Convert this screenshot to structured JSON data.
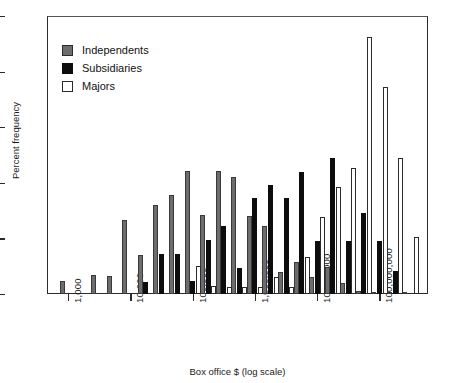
{
  "chart_data": {
    "type": "bar",
    "title": "",
    "xlabel": "Box office $ (log scale)",
    "ylabel": "Percent frequency",
    "ylim": [
      0,
      25
    ],
    "yticks": [
      0,
      5,
      10,
      15,
      20,
      25
    ],
    "xticks": [
      "1,000",
      "10,000",
      "100,000",
      "1,000,000",
      "10,000,000",
      "100,000,000"
    ],
    "xscale": "log",
    "grid": false,
    "legend_position": "top-left",
    "legend": [
      "Independents",
      "Subsidiaries",
      "Majors"
    ],
    "colors": {
      "independents": "#6d6d6d",
      "subsidiaries": "#0d0d0d",
      "majors": "#ffffff",
      "axis": "#2b2b2b"
    },
    "bin_centers_log10": [
      3.0,
      3.5,
      3.75,
      4.0,
      4.25,
      4.5,
      4.75,
      5.0,
      5.25,
      5.5,
      5.75,
      6.0,
      6.25,
      6.5,
      6.75,
      7.0,
      7.25,
      7.5,
      7.75,
      8.0,
      8.25,
      8.5
    ],
    "series": [
      {
        "name": "Independents",
        "values": [
          1.2,
          1.7,
          1.6,
          6.7,
          3.5,
          8.0,
          8.9,
          3.6,
          11.1,
          7.1,
          11.1,
          10.5,
          7.0,
          6.1,
          2.0,
          2.9,
          1.5,
          2.4,
          1.0,
          0.25,
          0.2,
          0.2,
          0.2
        ]
      },
      {
        "name": "Subsidiaries",
        "values": [
          0,
          0,
          0,
          0,
          1.1,
          3.6,
          3.6,
          1.2,
          4.9,
          2.3,
          8.6,
          9.8,
          8.6,
          11.0,
          4.8,
          12.2,
          4.8,
          7.3,
          4.8,
          2.1,
          0
        ]
      },
      {
        "name": "Majors",
        "values": [
          0,
          0,
          0,
          0,
          0,
          0,
          2.5,
          0.7,
          0.65,
          1.5,
          0.6,
          3.3,
          6.9,
          9.6,
          11.3,
          23.1,
          18.6,
          12.2,
          5.1
        ]
      }
    ],
    "groups": [
      {
        "log10": 3.0,
        "independents": 1.2,
        "subsidiaries": 0,
        "majors": 0
      },
      {
        "log10": 3.5,
        "independents": 1.7,
        "subsidiaries": 0,
        "majors": 0
      },
      {
        "log10": 3.75,
        "independents": 1.6,
        "subsidiaries": 0,
        "majors": 0
      },
      {
        "log10": 4.0,
        "independents": 6.7,
        "subsidiaries": 0,
        "majors": 0
      },
      {
        "log10": 4.25,
        "independents": 3.5,
        "subsidiaries": 1.1,
        "majors": 0
      },
      {
        "log10": 4.5,
        "independents": 8.0,
        "subsidiaries": 3.6,
        "majors": 0
      },
      {
        "log10": 4.75,
        "independents": 8.9,
        "subsidiaries": 3.6,
        "majors": 0
      },
      {
        "log10": 5.0,
        "independents": 11.1,
        "subsidiaries": 1.2,
        "majors": 2.5
      },
      {
        "log10": 5.25,
        "independents": 7.1,
        "subsidiaries": 4.9,
        "majors": 0.7
      },
      {
        "log10": 5.5,
        "independents": 11.1,
        "subsidiaries": 6.1,
        "majors": 0.65
      },
      {
        "log10": 5.75,
        "independents": 10.5,
        "subsidiaries": 2.3,
        "majors": 0.65
      },
      {
        "log10": 6.0,
        "independents": 7.0,
        "subsidiaries": 8.6,
        "majors": 0.6
      },
      {
        "log10": 6.25,
        "independents": 6.1,
        "subsidiaries": 9.8,
        "majors": 1.5
      },
      {
        "log10": 6.5,
        "independents": 2.0,
        "subsidiaries": 8.6,
        "majors": 0.6
      },
      {
        "log10": 6.75,
        "independents": 2.9,
        "subsidiaries": 11.0,
        "majors": 3.3
      },
      {
        "log10": 7.0,
        "independents": 1.5,
        "subsidiaries": 4.8,
        "majors": 6.9
      },
      {
        "log10": 7.25,
        "independents": 2.4,
        "subsidiaries": 12.2,
        "majors": 9.6
      },
      {
        "log10": 7.5,
        "independents": 1.0,
        "subsidiaries": 4.8,
        "majors": 11.3
      },
      {
        "log10": 7.75,
        "independents": 0.25,
        "subsidiaries": 7.3,
        "majors": 23.1
      },
      {
        "log10": 8.0,
        "independents": 0.2,
        "subsidiaries": 4.8,
        "majors": 18.6
      },
      {
        "log10": 8.25,
        "independents": 0.2,
        "subsidiaries": 2.1,
        "majors": 12.2
      },
      {
        "log10": 8.5,
        "independents": 0.2,
        "subsidiaries": 0,
        "majors": 5.1
      }
    ]
  }
}
